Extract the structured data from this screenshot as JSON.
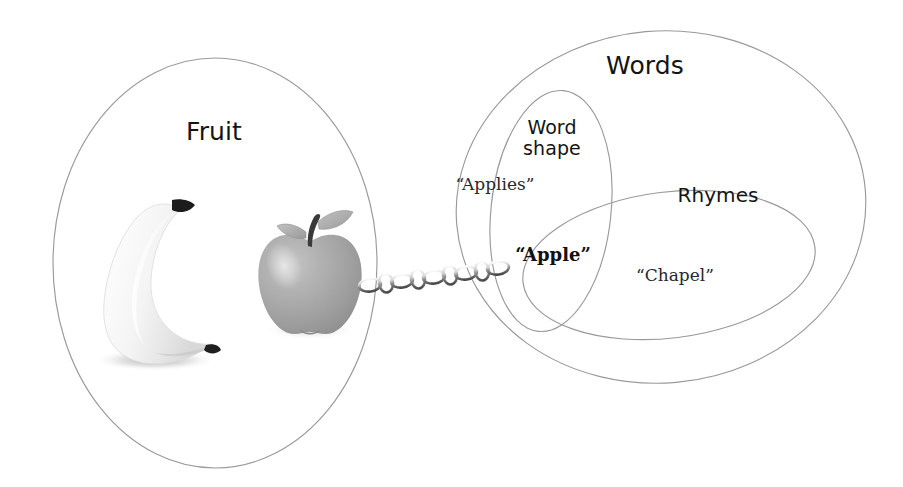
{
  "diagram": {
    "background_color": "#ffffff",
    "outline_color": "#9a9a9a",
    "sets": [
      {
        "id": "fruit",
        "label": "Fruit",
        "shape": "circle",
        "label_color": "#141414"
      },
      {
        "id": "words",
        "label": "Words",
        "shape": "ellipse",
        "label_color": "#141414"
      },
      {
        "id": "word-shape",
        "label": "Word\nshape",
        "shape": "ellipse",
        "label_color": "#141414"
      },
      {
        "id": "rhymes",
        "label": "Rhymes",
        "shape": "ellipse",
        "label_color": "#141414"
      }
    ],
    "tokens": [
      {
        "id": "applies",
        "text": "“Applies”",
        "weight": "normal",
        "member_of": "word-shape"
      },
      {
        "id": "apple",
        "text": "“Apple”",
        "weight": "bold",
        "member_of": "word-shape-and-rhymes"
      },
      {
        "id": "chapel",
        "text": "“Chapel”",
        "weight": "normal",
        "member_of": "rhymes"
      }
    ],
    "objects": [
      {
        "id": "banana",
        "name": "banana-illustration",
        "member_of": "fruit"
      },
      {
        "id": "apple-fruit",
        "name": "apple-illustration",
        "member_of": "fruit"
      }
    ],
    "link": {
      "id": "chain",
      "name": "chain-link-connector",
      "from": "apple-illustration",
      "to": "apple-word",
      "link_count": 9
    }
  }
}
